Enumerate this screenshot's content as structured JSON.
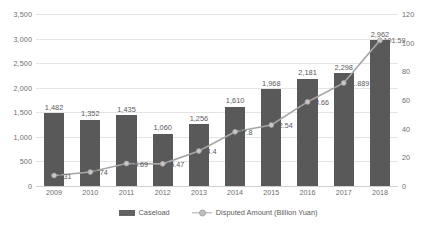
{
  "chart_data": {
    "type": "bar",
    "title": "",
    "xlabel": "",
    "ylabel": "",
    "categories": [
      "2009",
      "2010",
      "2011",
      "2012",
      "2013",
      "2014",
      "2015",
      "2016",
      "2017",
      "2018"
    ],
    "grid": true,
    "legend_position": "bottom",
    "series": [
      {
        "name": "Caseload",
        "type": "bar",
        "axis": "left",
        "values": [
          1482,
          1352,
          1435,
          1060,
          1256,
          1610,
          1968,
          2181,
          2298,
          2962
        ],
        "labels": [
          "1,482",
          "1,352",
          "1,435",
          "1,060",
          "1,256",
          "1,610",
          "1,968",
          "2,181",
          "2,298",
          "2,962"
        ],
        "color": "#595959"
      },
      {
        "name": "Disputed Amount (Billion Yuan)",
        "type": "line",
        "axis": "right",
        "values": [
          7.31,
          9.74,
          15.69,
          15.47,
          24.4,
          37.8,
          42.54,
          58.66,
          71.889,
          101.59
        ],
        "labels": [
          "7.31",
          "9.74",
          "15.69",
          "15.47",
          "24.4",
          "37.8",
          "42.54",
          "58.66",
          "71.889",
          "101.59"
        ],
        "color": "#a6a6a6"
      }
    ],
    "y_left": {
      "min": 0,
      "max": 3500,
      "step": 500,
      "ticks": [
        0,
        500,
        1000,
        1500,
        2000,
        2500,
        3000,
        3500
      ],
      "tick_labels": [
        "0",
        "500",
        "1,000",
        "1,500",
        "2,000",
        "2,500",
        "3,000",
        "3,500"
      ]
    },
    "y_right": {
      "min": 0,
      "max": 120,
      "step": 20,
      "ticks": [
        0,
        20,
        40,
        60,
        80,
        100,
        120
      ],
      "tick_labels": [
        "0",
        "20",
        "40",
        "60",
        "80",
        "100",
        "120"
      ]
    }
  },
  "legend": {
    "items": [
      {
        "label": "Caseload"
      },
      {
        "label": "Disputed Amount (Billion Yuan)"
      }
    ]
  }
}
